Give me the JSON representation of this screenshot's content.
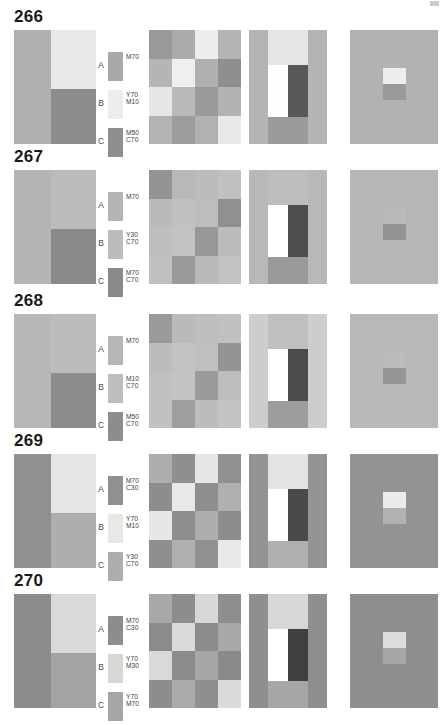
{
  "page": {
    "corner_mark": "page-corner-mark",
    "width": 445,
    "height": 699
  },
  "legend_letters": [
    "A",
    "B",
    "C"
  ],
  "rows": [
    {
      "number": "266",
      "top": 8,
      "legend": [
        {
          "letter": "A",
          "codes": [
            "M70"
          ],
          "color": "#a9a9a9"
        },
        {
          "letter": "B",
          "codes": [
            "Y70",
            "M10"
          ],
          "color": "#ececeb"
        },
        {
          "letter": "C",
          "codes": [
            "M50",
            "C70"
          ],
          "color": "#8e8e8e"
        }
      ],
      "panel1": {
        "left": "#b0b0b0",
        "top_right": "#e9e9e8",
        "bottom_right": "#8d8d8d"
      },
      "panel2": {
        "cells": [
          "#999999",
          "#ababab",
          "#eeeeec",
          "#b4b4b4",
          "#b5b5b5",
          "#efefed",
          "#b0b0b0",
          "#8f8f8f",
          "#e6e6e4",
          "#b9b9b9",
          "#9a9a9a",
          "#b2b2b2",
          "#b3b3b3",
          "#9c9c9c",
          "#b1b1b1",
          "#e9e9e7"
        ]
      },
      "panel3": {
        "ground": "#b4b4b4",
        "top_band": "#e6e6e4",
        "bottom_band": "#9b9b9b",
        "bar_light": "#fefefe",
        "bar_dark": "#585858"
      },
      "panel4": {
        "field": "#b2b2b2",
        "patch_top": "#ededeb",
        "patch_bottom": "#9a9a9a"
      }
    },
    {
      "number": "267",
      "top": 148,
      "legend": [
        {
          "letter": "A",
          "codes": [
            "M70"
          ],
          "color": "#b4b4b4"
        },
        {
          "letter": "B",
          "codes": [
            "Y30",
            "C70"
          ],
          "color": "#bcbcbc"
        },
        {
          "letter": "C",
          "codes": [
            "M70",
            "C70"
          ],
          "color": "#8a8a8a"
        }
      ],
      "panel1": {
        "left": "#b5b5b5",
        "top_right": "#bbbbbb",
        "bottom_right": "#8a8a8a"
      },
      "panel2": {
        "cells": [
          "#949494",
          "#b8b8b8",
          "#bcbcbc",
          "#c0c0c0",
          "#bababa",
          "#c1c1c1",
          "#bdbdbd",
          "#909090",
          "#bebebe",
          "#c2c2c2",
          "#979797",
          "#bcbcbc",
          "#c0c0c0",
          "#9a9a9a",
          "#bababa",
          "#c2c2c2"
        ]
      },
      "panel3": {
        "ground": "#b8b8b8",
        "top_band": "#bdbdbd",
        "bottom_band": "#9a9a9a",
        "bar_light": "#ffffff",
        "bar_dark": "#4e4e4e"
      },
      "panel4": {
        "field": "#b6b6b6",
        "patch_top": "#babab9",
        "patch_bottom": "#939393"
      }
    },
    {
      "number": "268",
      "top": 292,
      "legend": [
        {
          "letter": "A",
          "codes": [
            "M70"
          ],
          "color": "#b6b6b6"
        },
        {
          "letter": "B",
          "codes": [
            "M10",
            "C70"
          ],
          "color": "#bdbdbd"
        },
        {
          "letter": "C",
          "codes": [
            "M50",
            "C70"
          ],
          "color": "#8d8d8d"
        }
      ],
      "panel1": {
        "left": "#b7b7b7",
        "top_right": "#bcbcbc",
        "bottom_right": "#8c8c8c"
      },
      "panel2": {
        "cells": [
          "#9a9a9a",
          "#bababa",
          "#bebebe",
          "#c1c1c1",
          "#bcbcbc",
          "#c2c2c2",
          "#bfbfbf",
          "#949494",
          "#c0c0c0",
          "#c3c3c3",
          "#9b9b9b",
          "#bdbdbd",
          "#c1c1c1",
          "#9e9e9e",
          "#bcbcbc",
          "#c3c3c3"
        ]
      },
      "panel3": {
        "ground": "#babababa",
        "top_band": "#bfbfbf",
        "bottom_band": "#9d9d9d",
        "bar_light": "#ffffff",
        "bar_dark": "#4b4b4b"
      },
      "panel4": {
        "field": "#b8b8b8",
        "patch_top": "#bbbbbb",
        "patch_bottom": "#959595"
      }
    },
    {
      "number": "269",
      "top": 432,
      "legend": [
        {
          "letter": "A",
          "codes": [
            "M70",
            "C30"
          ],
          "color": "#909090"
        },
        {
          "letter": "B",
          "codes": [
            "Y70",
            "M10"
          ],
          "color": "#e8e8e6"
        },
        {
          "letter": "C",
          "codes": [
            "Y30",
            "C70"
          ],
          "color": "#aeaeae"
        }
      ],
      "panel1": {
        "left": "#909090",
        "top_right": "#e5e5e3",
        "bottom_right": "#aeaeae"
      },
      "panel2": {
        "cells": [
          "#adadad",
          "#8f8f8f",
          "#e6e6e4",
          "#909090",
          "#8d8d8d",
          "#e8e8e6",
          "#8e8e8e",
          "#b0b0b0",
          "#e7e7e5",
          "#8e8e8e",
          "#aeaeae",
          "#8c8c8c",
          "#8f8f8f",
          "#b0b0b0",
          "#919191",
          "#e9e9e7"
        ]
      },
      "panel3": {
        "ground": "#949494",
        "top_band": "#e4e4e2",
        "bottom_band": "#b0b0b0",
        "bar_light": "#ffffff",
        "bar_dark": "#4a4a4a"
      },
      "panel4": {
        "field": "#939393",
        "patch_top": "#ebebe9",
        "patch_bottom": "#b1b1b1"
      }
    },
    {
      "number": "270",
      "top": 572,
      "legend": [
        {
          "letter": "A",
          "codes": [
            "M70",
            "C30"
          ],
          "color": "#8d8d8d"
        },
        {
          "letter": "B",
          "codes": [
            "Y70",
            "M30"
          ],
          "color": "#d7d7d5"
        },
        {
          "letter": "C",
          "codes": [
            "Y70",
            "M70"
          ],
          "color": "#a5a5a5"
        }
      ],
      "panel1": {
        "left": "#8c8c8c",
        "top_right": "#d9d9d7",
        "bottom_right": "#a3a3a3"
      },
      "panel2": {
        "cells": [
          "#a8a8a8",
          "#8d8d8d",
          "#d8d8d6",
          "#8e8e8e",
          "#8b8b8b",
          "#dadad8",
          "#8c8c8c",
          "#a9a9a9",
          "#d9d9d7",
          "#8c8c8c",
          "#a7a7a7",
          "#8a8a8a",
          "#8d8d8d",
          "#aaaaaa",
          "#8f8f8f",
          "#dbdbd9"
        ]
      },
      "panel3": {
        "ground": "#8f8f8f",
        "top_band": "#d7d7d5",
        "bottom_band": "#a6a6a6",
        "bar_light": "#ffffff",
        "bar_dark": "#3f3f3f"
      },
      "panel4": {
        "field": "#8e8e8e",
        "patch_top": "#dcdcda",
        "patch_bottom": "#a6a6a6"
      }
    }
  ]
}
